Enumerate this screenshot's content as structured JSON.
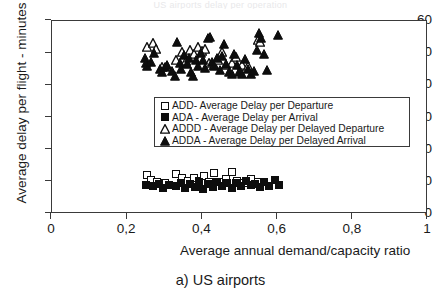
{
  "figure": {
    "caption": "a) US airports",
    "top_clipped_text": "US airports delay per operation"
  },
  "axes": {
    "y_title": "Average delay per flight - minutes",
    "x_title": "Average annual demand/capacity ratio",
    "y_ticks": [
      "0",
      "10",
      "20",
      "30",
      "40",
      "50",
      "60"
    ],
    "x_ticks": [
      "0",
      "0,2",
      "0,4",
      "0,6",
      "0,8",
      "1"
    ],
    "y_tick_values": [
      0,
      10,
      20,
      30,
      40,
      50,
      60
    ],
    "x_tick_values": [
      0,
      0.2,
      0.4,
      0.6,
      0.8,
      1.0
    ]
  },
  "legend": {
    "items": [
      {
        "marker": "square-open",
        "label": "ADD- Average Delay per Departure"
      },
      {
        "marker": "square-filled",
        "label": "ADA - Average Delay per Arrival"
      },
      {
        "marker": "triangle-open",
        "label": "ADDD - Average Delay per Delayed Departure"
      },
      {
        "marker": "triangle-filled",
        "label": "ADDA - Average Delay per Delayed Arrival"
      }
    ]
  },
  "chart_data": {
    "type": "scatter",
    "title": "",
    "xlabel": "Average annual demand/capacity ratio",
    "ylabel": "Average delay per flight - minutes",
    "xlim": [
      0,
      1
    ],
    "ylim": [
      0,
      60
    ],
    "grid": false,
    "legend_position": "inside-center",
    "colors": {
      "marker_stroke": "#0d0d0d",
      "marker_fill_open": "#ffffff",
      "marker_fill_solid": "#0d0d0d",
      "axis": "#3a3a3a"
    },
    "series": [
      {
        "name": "ADD- Average Delay per Departure",
        "marker": "square-open",
        "points": [
          [
            0.253,
            12.1
          ],
          [
            0.262,
            10.6
          ],
          [
            0.28,
            10.0
          ],
          [
            0.3,
            9.6
          ],
          [
            0.33,
            12.4
          ],
          [
            0.345,
            11.3
          ],
          [
            0.362,
            10.4
          ],
          [
            0.378,
            11.1
          ],
          [
            0.392,
            10.2
          ],
          [
            0.405,
            11.9
          ],
          [
            0.418,
            10.1
          ],
          [
            0.432,
            12.6
          ],
          [
            0.447,
            9.8
          ],
          [
            0.462,
            11.0
          ],
          [
            0.478,
            13.0
          ],
          [
            0.492,
            10.4
          ],
          [
            0.51,
            9.5
          ],
          [
            0.528,
            10.8
          ],
          [
            0.548,
            10.0
          ]
        ]
      },
      {
        "name": "ADA - Average Delay per Arrival",
        "marker": "square-filled",
        "points": [
          [
            0.25,
            9.1
          ],
          [
            0.268,
            8.6
          ],
          [
            0.285,
            9.4
          ],
          [
            0.296,
            8.2
          ],
          [
            0.312,
            9.0
          ],
          [
            0.33,
            8.7
          ],
          [
            0.342,
            9.6
          ],
          [
            0.355,
            8.1
          ],
          [
            0.368,
            9.3
          ],
          [
            0.38,
            8.5
          ],
          [
            0.392,
            9.9
          ],
          [
            0.402,
            7.9
          ],
          [
            0.415,
            9.2
          ],
          [
            0.428,
            8.4
          ],
          [
            0.44,
            10.1
          ],
          [
            0.452,
            8.8
          ],
          [
            0.465,
            9.5
          ],
          [
            0.478,
            8.0
          ],
          [
            0.49,
            9.7
          ],
          [
            0.502,
            8.6
          ],
          [
            0.515,
            10.3
          ],
          [
            0.528,
            8.9
          ],
          [
            0.54,
            9.4
          ],
          [
            0.552,
            8.3
          ],
          [
            0.565,
            9.8
          ],
          [
            0.578,
            8.7
          ],
          [
            0.592,
            10.6
          ],
          [
            0.605,
            9.1
          ]
        ]
      },
      {
        "name": "ADDD - Average Delay per Delayed Departure",
        "marker": "triangle-open",
        "points": [
          [
            0.252,
            52.0
          ],
          [
            0.268,
            53.2
          ],
          [
            0.276,
            51.4
          ],
          [
            0.292,
            45.6
          ],
          [
            0.305,
            46.0
          ],
          [
            0.33,
            48.0
          ],
          [
            0.345,
            50.4
          ],
          [
            0.356,
            47.6
          ],
          [
            0.366,
            51.0
          ],
          [
            0.378,
            49.6
          ],
          [
            0.388,
            52.0
          ],
          [
            0.398,
            50.8
          ],
          [
            0.408,
            51.4
          ],
          [
            0.418,
            47.0
          ],
          [
            0.432,
            46.2
          ],
          [
            0.442,
            48.0
          ],
          [
            0.452,
            50.4
          ],
          [
            0.462,
            46.4
          ],
          [
            0.478,
            47.0
          ],
          [
            0.49,
            48.8
          ],
          [
            0.506,
            46.2
          ],
          [
            0.52,
            46.0
          ],
          [
            0.548,
            54.0
          ],
          [
            0.552,
            53.6
          ]
        ]
      },
      {
        "name": "ADDA - Average Delay per Delayed Arrival",
        "marker": "triangle-filled",
        "points": [
          [
            0.248,
            48.6
          ],
          [
            0.25,
            46.8
          ],
          [
            0.252,
            46.0
          ],
          [
            0.262,
            47.4
          ],
          [
            0.272,
            50.0
          ],
          [
            0.286,
            45.2
          ],
          [
            0.292,
            44.0
          ],
          [
            0.3,
            45.8
          ],
          [
            0.306,
            46.4
          ],
          [
            0.32,
            44.4
          ],
          [
            0.326,
            43.0
          ],
          [
            0.332,
            53.6
          ],
          [
            0.34,
            47.0
          ],
          [
            0.344,
            45.0
          ],
          [
            0.352,
            49.4
          ],
          [
            0.358,
            46.6
          ],
          [
            0.364,
            48.4
          ],
          [
            0.37,
            44.2
          ],
          [
            0.376,
            43.0
          ],
          [
            0.382,
            47.8
          ],
          [
            0.388,
            46.0
          ],
          [
            0.396,
            50.2
          ],
          [
            0.402,
            48.0
          ],
          [
            0.408,
            45.4
          ],
          [
            0.414,
            54.6
          ],
          [
            0.42,
            55.0
          ],
          [
            0.426,
            47.4
          ],
          [
            0.432,
            46.0
          ],
          [
            0.44,
            48.4
          ],
          [
            0.446,
            44.8
          ],
          [
            0.452,
            49.2
          ],
          [
            0.458,
            53.0
          ],
          [
            0.464,
            46.6
          ],
          [
            0.47,
            44.0
          ],
          [
            0.478,
            43.6
          ],
          [
            0.484,
            49.8
          ],
          [
            0.492,
            46.4
          ],
          [
            0.498,
            44.2
          ],
          [
            0.506,
            43.4
          ],
          [
            0.512,
            48.2
          ],
          [
            0.52,
            45.2
          ],
          [
            0.528,
            43.6
          ],
          [
            0.536,
            44.6
          ],
          [
            0.544,
            51.0
          ],
          [
            0.55,
            56.4
          ],
          [
            0.556,
            54.8
          ],
          [
            0.564,
            49.6
          ],
          [
            0.572,
            44.8
          ],
          [
            0.6,
            55.8
          ]
        ]
      }
    ]
  }
}
